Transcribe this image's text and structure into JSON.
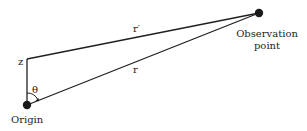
{
  "diagram": {
    "labels": {
      "z": "z",
      "theta": "θ",
      "r_prime": "r′",
      "r": "r",
      "origin": "Origin",
      "observation_line1": "Observation",
      "observation_line2": "point"
    },
    "points": {
      "origin": {
        "x": 27,
        "y": 105
      },
      "z_point": {
        "x": 27,
        "y": 59
      },
      "observation": {
        "x": 259,
        "y": 13
      }
    },
    "colors": {
      "stroke": "#231f20",
      "dot": "#1a1a1a",
      "background": "#ffffff"
    }
  }
}
